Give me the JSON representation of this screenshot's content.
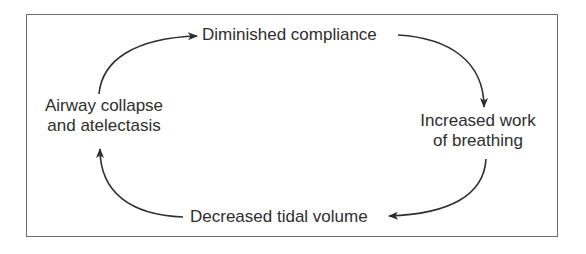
{
  "diagram": {
    "type": "cycle",
    "frame": {
      "border_color": "#6e6e6e"
    },
    "arrow_color": "#2e2e2e",
    "text_color": "#2e2e2e",
    "nodes": [
      {
        "id": "top",
        "lines": [
          "Diminished compliance"
        ]
      },
      {
        "id": "right",
        "lines": [
          "Increased work",
          "of breathing"
        ]
      },
      {
        "id": "bottom",
        "lines": [
          "Decreased tidal volume"
        ]
      },
      {
        "id": "left",
        "lines": [
          "Airway collapse",
          "and atelectasis"
        ]
      }
    ],
    "edges": [
      {
        "from": "left",
        "to": "top",
        "direction": "clockwise"
      },
      {
        "from": "top",
        "to": "right",
        "direction": "clockwise"
      },
      {
        "from": "right",
        "to": "bottom",
        "direction": "clockwise"
      },
      {
        "from": "bottom",
        "to": "left",
        "direction": "clockwise"
      }
    ]
  }
}
